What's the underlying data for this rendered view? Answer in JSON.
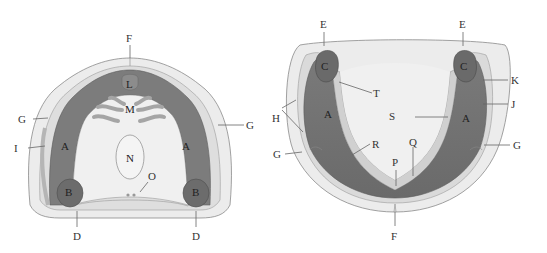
{
  "colors": {
    "outer_fill": "#ececec",
    "outer_stroke": "#8a8a8a",
    "mid_fill": "#dcdcdc",
    "ridge_dark": "#7d7d7d",
    "ridge_mid": "#9a9a9a",
    "pad_fill": "#6f6f6f",
    "inner_fill": "#f2f2f2",
    "rugae_fill": "#a8a8a8"
  },
  "left_diagram": {
    "name": "maxillary-arch",
    "labels": {
      "F": "F",
      "L": "L",
      "M": "M",
      "N": "N",
      "O": "O",
      "A_left": "A",
      "A_right": "A",
      "B_left": "B",
      "B_right": "B",
      "G_left": "G",
      "G_right": "G",
      "I": "I",
      "D_left": "D",
      "D_right": "D"
    }
  },
  "right_diagram": {
    "name": "mandibular-arch",
    "labels": {
      "E_left": "E",
      "E_right": "E",
      "C_left": "C",
      "C_right": "C",
      "T": "T",
      "K": "K",
      "J": "J",
      "H": "H",
      "S": "S",
      "A_left": "A",
      "A_right": "A",
      "G_left": "G",
      "G_right": "G",
      "R": "R",
      "Q": "Q",
      "P": "P",
      "F": "F"
    }
  }
}
